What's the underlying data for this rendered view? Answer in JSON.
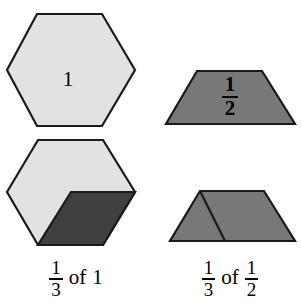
{
  "figure": {
    "background": "#ffffff",
    "width": 302,
    "height": 308,
    "colors": {
      "light_gray_fill": "#e2e2e2",
      "medium_gray_fill": "#787878",
      "dark_gray_fill": "#404040",
      "outline": "#1a1a1a",
      "text": "#000000"
    }
  },
  "shapes": {
    "top_left_hexagon": {
      "name": "hexagon-whole",
      "fill": "#e2e2e2",
      "label": "1",
      "points": "37,14 102,14 135,70 102,126 37,126 7,70"
    },
    "top_right_trapezoid": {
      "name": "trapezoid-half",
      "fill": "#787878",
      "label_numerator": "1",
      "label_denominator": "2",
      "points": "197,71 262,71 295,124 166,124"
    },
    "bottom_left_hexagon": {
      "name": "hexagon-third-of-one",
      "fill": "#e2e2e2",
      "points": "38,140 103,140 135,192 103,245 38,245 7,192",
      "shaded_piece": {
        "name": "rhombus-one-third",
        "fill": "#404040",
        "points": "71,192 135,192 103,245 38,245"
      }
    },
    "bottom_right_trapezoid": {
      "name": "trapezoid-third-of-half",
      "fill": "#787878",
      "points": "200,191 264,191 295,241 170,241",
      "divider_line": {
        "name": "trapezoid-divider",
        "from": "200,191",
        "to": "225,241"
      }
    }
  },
  "captions": {
    "left": {
      "numerator": "1",
      "denominator": "3",
      "connector": "of",
      "operand": "1"
    },
    "right": {
      "numerator": "1",
      "denominator": "3",
      "connector": "of",
      "operand_numerator": "1",
      "operand_denominator": "2"
    }
  }
}
